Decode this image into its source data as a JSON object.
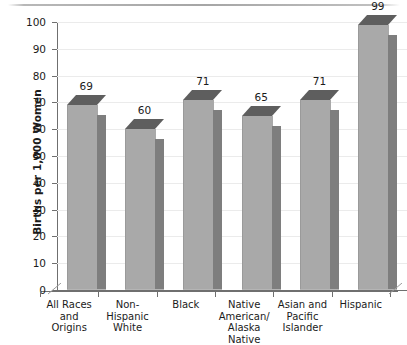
{
  "chart_data": {
    "type": "bar",
    "title": "",
    "subtitle": "",
    "xlabel": "",
    "ylabel": "Births per 1,000 Women",
    "ylim": [
      0,
      100
    ],
    "ytick_step": 10,
    "yticks": [
      0,
      10,
      20,
      30,
      40,
      50,
      60,
      70,
      80,
      90,
      100
    ],
    "grid": true,
    "legend": false,
    "legend_position": "none",
    "style": "3d-column",
    "categories": [
      "All Races and Origins",
      "Non-Hispanic White",
      "Black",
      "Native American/ Alaska Native",
      "Asian and Pacific Islander",
      "Hispanic"
    ],
    "category_lines": [
      [
        "All Races",
        "and",
        "Origins"
      ],
      [
        "Non-",
        "Hispanic",
        "White"
      ],
      [
        "Black"
      ],
      [
        "Native",
        "American/",
        "Alaska",
        "Native"
      ],
      [
        "Asian and",
        "Pacific",
        "Islander"
      ],
      [
        "Hispanic"
      ]
    ],
    "values": [
      69,
      60,
      71,
      65,
      71,
      99
    ],
    "value_labels": [
      "69",
      "60",
      "71",
      "65",
      "71",
      "99"
    ],
    "colors": {
      "bar_front": "#a9a9a9",
      "bar_side": "#7e7e7e",
      "bar_top": "#5e5e5e",
      "gridline": "#ebebeb",
      "axis": "#6f6f6f",
      "text": "#1b1b1b",
      "background": "#ffffff"
    }
  }
}
